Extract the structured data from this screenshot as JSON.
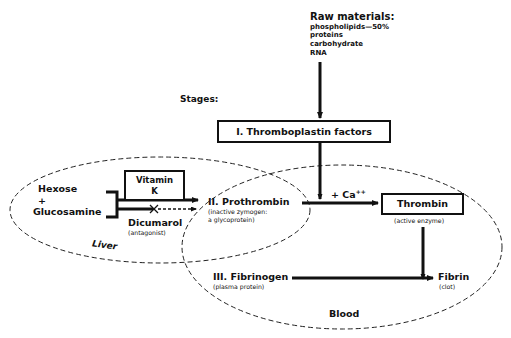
{
  "raw_materials": {
    "title": "Raw materials:",
    "items": [
      "phospholipids—50%",
      "proteins",
      "carbohydrate",
      "RNA"
    ]
  },
  "stages_label": "Stages:",
  "stage1": {
    "label": "I. Thromboplastin factors"
  },
  "liver": {
    "region_label": "Liver",
    "precursor_line1": "Hexose",
    "precursor_plus": "+",
    "precursor_line2": "Glucosamine",
    "vitamin_k_line1": "Vitamin",
    "vitamin_k_line2": "K",
    "antagonist_name": "Dicumarol",
    "antagonist_note": "(antagonist)",
    "block_symbol": "×"
  },
  "stage2": {
    "label": "II. Prothrombin",
    "note_line1": "(inactive zymogen:",
    "note_line2": "a glycoprotein)"
  },
  "calcium": {
    "label": "+ Ca",
    "superscript": "++"
  },
  "thrombin": {
    "label": "Thrombin",
    "note": "(active enzyme)"
  },
  "stage3": {
    "label": "III. Fibrinogen",
    "note": "(plasma protein)"
  },
  "fibrin": {
    "label": "Fibrin",
    "note": "(clot)"
  },
  "blood": {
    "region_label": "Blood"
  },
  "colors": {
    "ink": "#111111",
    "background": "#ffffff"
  }
}
